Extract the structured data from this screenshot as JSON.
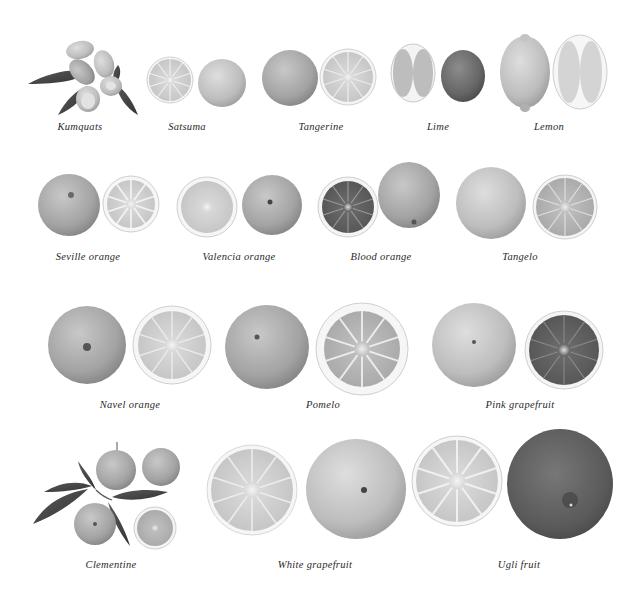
{
  "plate": {
    "background": "#ffffff",
    "style": "grayscale botanical illustration of citrus fruits",
    "rows": [
      {
        "items": [
          {
            "id": "kumquats",
            "label": "Kumquats",
            "label_x": 80,
            "label_y": 121
          },
          {
            "id": "satsuma",
            "label": "Satsuma",
            "label_x": 187,
            "label_y": 121
          },
          {
            "id": "tangerine",
            "label": "Tangerine",
            "label_x": 321,
            "label_y": 121
          },
          {
            "id": "lime",
            "label": "Lime",
            "label_x": 438,
            "label_y": 121
          },
          {
            "id": "lemon",
            "label": "Lemon",
            "label_x": 549,
            "label_y": 121
          }
        ]
      },
      {
        "items": [
          {
            "id": "seville-orange",
            "label": "Seville orange",
            "label_x": 88,
            "label_y": 251
          },
          {
            "id": "valencia-orange",
            "label": "Valencia orange",
            "label_x": 239,
            "label_y": 251
          },
          {
            "id": "blood-orange",
            "label": "Blood orange",
            "label_x": 381,
            "label_y": 251
          },
          {
            "id": "tangelo",
            "label": "Tangelo",
            "label_x": 520,
            "label_y": 251
          }
        ]
      },
      {
        "items": [
          {
            "id": "navel-orange",
            "label": "Navel orange",
            "label_x": 130,
            "label_y": 399
          },
          {
            "id": "pomelo",
            "label": "Pomelo",
            "label_x": 323,
            "label_y": 399
          },
          {
            "id": "pink-grapefruit",
            "label": "Pink grapefruit",
            "label_x": 520,
            "label_y": 399
          }
        ]
      },
      {
        "items": [
          {
            "id": "clementine",
            "label": "Clementine",
            "label_x": 111,
            "label_y": 559
          },
          {
            "id": "white-grapefruit",
            "label": "White grapefruit",
            "label_x": 315,
            "label_y": 559
          },
          {
            "id": "ugli-fruit",
            "label": "Ugli fruit",
            "label_x": 519,
            "label_y": 559
          }
        ]
      }
    ]
  },
  "colors": {
    "peel_light": "#c9c9c9",
    "peel_mid": "#a9a9a9",
    "peel_dark": "#7d7d7d",
    "flesh": "#dcdcdc",
    "flesh_dark": "#6e6e6e",
    "pith": "#f4f4f4",
    "leaf": "#4a4a4a",
    "text": "#2a2a2a"
  }
}
